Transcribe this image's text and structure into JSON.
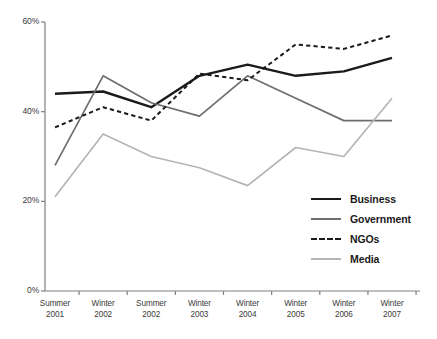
{
  "chart_data": {
    "type": "line",
    "title": "",
    "subtitle": "",
    "xlabel": "",
    "ylabel": "",
    "categories": [
      "Summer 2001",
      "Winter 2002",
      "Summer 2002",
      "Winter 2003",
      "Winter 2004",
      "Winter 2005",
      "Winter 2006",
      "Winter 2007"
    ],
    "category_lines": [
      [
        "Summer",
        "2001"
      ],
      [
        "Winter",
        "2002"
      ],
      [
        "Summer",
        "2002"
      ],
      [
        "Winter",
        "2003"
      ],
      [
        "Winter",
        "2004"
      ],
      [
        "Winter",
        "2005"
      ],
      [
        "Winter",
        "2006"
      ],
      [
        "Winter",
        "2007"
      ]
    ],
    "series": [
      {
        "name": "Business",
        "values": [
          44,
          44.5,
          41,
          48,
          50.5,
          48,
          49,
          52
        ],
        "color": "#1a1a1a",
        "width": 2.4,
        "dash": "none"
      },
      {
        "name": "Government",
        "values": [
          28,
          48,
          42,
          39,
          48,
          43,
          38,
          38
        ],
        "color": "#6e6e6e",
        "width": 1.7,
        "dash": "none"
      },
      {
        "name": "NGOs",
        "values": [
          36.5,
          41,
          38,
          48.5,
          47,
          55,
          54,
          57
        ],
        "color": "#1a1a1a",
        "width": 2.0,
        "dash": "dashed"
      },
      {
        "name": "Media",
        "values": [
          21,
          35,
          30,
          27.5,
          23.5,
          32,
          30,
          43
        ],
        "color": "#b5b5b5",
        "width": 1.7,
        "dash": "none"
      }
    ],
    "ylim": [
      0,
      60
    ],
    "yticks": [
      0,
      20,
      40,
      60
    ],
    "ytick_labels": [
      "0%",
      "20%",
      "40%",
      "60%"
    ],
    "grid": false,
    "legend_position": "inside-bottom-right",
    "axis_color": "#808080"
  }
}
